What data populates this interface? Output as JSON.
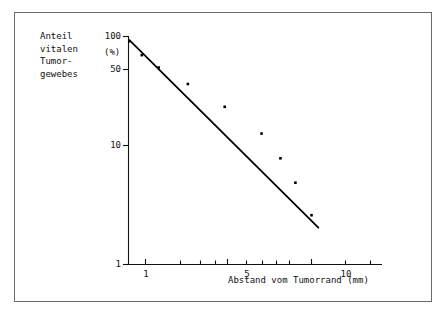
{
  "figure": {
    "background_color": "#ffffff",
    "frame_color": "#6b6b6b",
    "ink_color": "#000000"
  },
  "y_axis": {
    "title_lines": [
      "Anteil",
      "vitalen",
      "Tumor-",
      "gewebes"
    ],
    "unit_label": "(%)",
    "tick_labels": [
      "100",
      "50",
      "10",
      "1"
    ],
    "tick_values": [
      100,
      50,
      10,
      1
    ]
  },
  "x_axis": {
    "title": "Abstand vom Tumorrand (mm)",
    "tick_labels": [
      "1",
      "5",
      "10"
    ],
    "tick_values": [
      1,
      5,
      10
    ]
  },
  "chart_data": {
    "type": "scatter",
    "title": "",
    "subtitle": "",
    "xlabel": "Abstand vom Tumorrand (mm)",
    "ylabel": "Anteil vitalen Tumorgewebes (%)",
    "xscale": "log",
    "yscale": "log",
    "xlim": [
      0.78,
      11.5
    ],
    "ylim": [
      1,
      100
    ],
    "grid": false,
    "legend": null,
    "x_tick_labels": [
      "1",
      "5",
      "10"
    ],
    "x_tick_values": [
      1,
      5,
      10
    ],
    "x_minor_tick_values": [
      2,
      3,
      4,
      6,
      7,
      8,
      9
    ],
    "y_tick_labels": [
      "100",
      "50",
      "10",
      "1"
    ],
    "y_tick_values": [
      100,
      50,
      10,
      1
    ],
    "series": [
      {
        "name": "Messpunkte",
        "type": "scatter",
        "marker": "square",
        "color": "#000000",
        "x": [
          0.8,
          0.95,
          1.2,
          1.8,
          3.0,
          5.0,
          6.5,
          8.0,
          10.0
        ],
        "y": [
          90,
          68,
          53,
          38,
          24,
          14,
          8.5,
          5.2,
          2.7
        ]
      },
      {
        "name": "Regressionsgerade",
        "type": "line",
        "color": "#000000",
        "x": [
          0.8,
          11.0
        ],
        "y": [
          92,
          2.1
        ]
      }
    ]
  }
}
